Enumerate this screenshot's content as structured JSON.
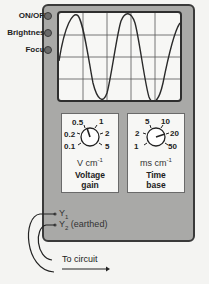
{
  "controls": [
    {
      "label": "ON/OFF"
    },
    {
      "label": "Brightness"
    },
    {
      "label": "Focus"
    }
  ],
  "voltage_gain": {
    "scale": [
      "0.1",
      "0.2",
      "0.5",
      "1",
      "2",
      "5"
    ],
    "unit_text": "V cm",
    "unit_exp": "-1",
    "title_line1": "Voltage",
    "title_line2": "gain"
  },
  "time_base": {
    "scale": [
      "1",
      "2",
      "5",
      "10",
      "20",
      "50"
    ],
    "unit_text": "ms cm",
    "unit_exp": "-1",
    "title_line1": "Time",
    "title_line2": "base"
  },
  "terminals": {
    "y1": {
      "main": "Y",
      "sub": "1",
      "suffix": ""
    },
    "y2": {
      "main": "Y",
      "sub": "2",
      "suffix": " (earthed)"
    }
  },
  "to_circuit": "To circuit",
  "colors": {
    "frame": "#a9a9a7",
    "screen": "#f7f7f5",
    "trace": "#2a2a2a",
    "grid": "#555555"
  }
}
